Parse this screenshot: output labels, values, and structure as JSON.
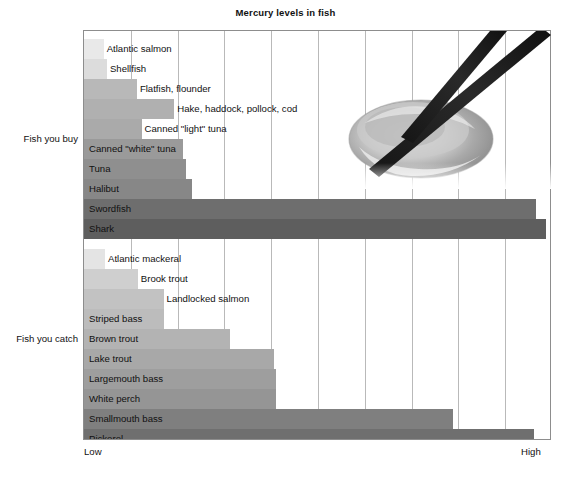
{
  "chart_data": {
    "type": "bar",
    "title": "Mercury levels in fish",
    "orientation": "horizontal",
    "xlabel": "",
    "ylabel": "",
    "axis_low_label": "Low",
    "axis_high_label": "High",
    "xlim": [
      0,
      10
    ],
    "grid": true,
    "gridline_count": 10,
    "legend": null,
    "groups": [
      {
        "name": "Fish you buy",
        "label": "Fish you buy",
        "categories": [
          "Atlantic salmon",
          "Shellfish",
          "Flatfish, flounder",
          "Hake, haddock, pollock, cod",
          "Canned \"light\" tuna",
          "Canned \"white\" tuna",
          "Tuna",
          "Halibut",
          "Swordfish",
          "Shark"
        ],
        "values": [
          0.42,
          0.49,
          1.13,
          1.93,
          1.23,
          2.12,
          2.17,
          2.3,
          9.66,
          9.87
        ],
        "colors": [
          "#e9e9e9",
          "#dcdcdc",
          "#b8b8b8",
          "#b0b0b0",
          "#aaaaaa",
          "#9a9a9a",
          "#8f8f8f",
          "#878787",
          "#6e6e6e",
          "#5e5e5e"
        ]
      },
      {
        "name": "Fish you catch",
        "label": "Fish you catch",
        "categories": [
          "Atlantic mackeral",
          "Brook trout",
          "Landlocked salmon",
          "Striped bass",
          "Brown trout",
          "Lake trout",
          "Largemouth bass",
          "White perch",
          "Smallmouth bass",
          "Pickerel"
        ],
        "values": [
          0.45,
          1.15,
          1.7,
          1.72,
          3.12,
          4.06,
          4.1,
          4.1,
          7.88,
          9.61
        ],
        "colors": [
          "#e4e4e4",
          "#cfcfcf",
          "#c2c2c2",
          "#bcbcbc",
          "#b3b3b3",
          "#a8a8a8",
          "#9e9e9e",
          "#959595",
          "#7f7f7f",
          "#6f6f6f"
        ]
      }
    ]
  },
  "photo": {
    "name": "sashimi-with-chopsticks-photo",
    "description": "grayscale photograph of a slice of raw fish held by chopsticks"
  }
}
